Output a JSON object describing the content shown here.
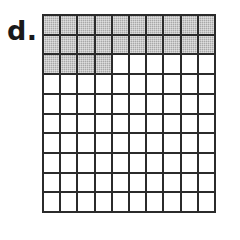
{
  "figure": {
    "item_label": "d.",
    "caption": ""
  },
  "colors": {
    "background": "#ffffff",
    "grid_line": "#2b2b2b",
    "shaded_cell": "#a8a8a8",
    "empty_cell": "#ffffff",
    "label_text": "#1a1a1a"
  },
  "chart_data": {
    "type": "heatmap",
    "title": "",
    "subtitle": "",
    "xlabel": "",
    "ylabel": "",
    "grid": true,
    "legend": false,
    "rows": 10,
    "columns": 10,
    "total_cells": 100,
    "shaded_cells": 24,
    "unshaded_cells": 76,
    "fraction_shaded": "24/100",
    "decimal_shaded": 0.24,
    "percent_shaded": 24,
    "shading_fill_order": "left-to-right, top-to-bottom",
    "categories": [
      "col 1",
      "col 2",
      "col 3",
      "col 4",
      "col 5",
      "col 6",
      "col 7",
      "col 8",
      "col 9",
      "col 10"
    ],
    "row_labels": [
      "row 1",
      "row 2",
      "row 3",
      "row 4",
      "row 5",
      "row 6",
      "row 7",
      "row 8",
      "row 9",
      "row 10"
    ],
    "shaded_per_row": [
      10,
      10,
      4,
      0,
      0,
      0,
      0,
      0,
      0,
      0
    ],
    "values": [
      [
        1,
        1,
        1,
        1,
        1,
        1,
        1,
        1,
        1,
        1
      ],
      [
        1,
        1,
        1,
        1,
        1,
        1,
        1,
        1,
        1,
        1
      ],
      [
        1,
        1,
        1,
        1,
        0,
        0,
        0,
        0,
        0,
        0
      ],
      [
        0,
        0,
        0,
        0,
        0,
        0,
        0,
        0,
        0,
        0
      ],
      [
        0,
        0,
        0,
        0,
        0,
        0,
        0,
        0,
        0,
        0
      ],
      [
        0,
        0,
        0,
        0,
        0,
        0,
        0,
        0,
        0,
        0
      ],
      [
        0,
        0,
        0,
        0,
        0,
        0,
        0,
        0,
        0,
        0
      ],
      [
        0,
        0,
        0,
        0,
        0,
        0,
        0,
        0,
        0,
        0
      ],
      [
        0,
        0,
        0,
        0,
        0,
        0,
        0,
        0,
        0,
        0
      ],
      [
        0,
        0,
        0,
        0,
        0,
        0,
        0,
        0,
        0,
        0
      ]
    ]
  }
}
